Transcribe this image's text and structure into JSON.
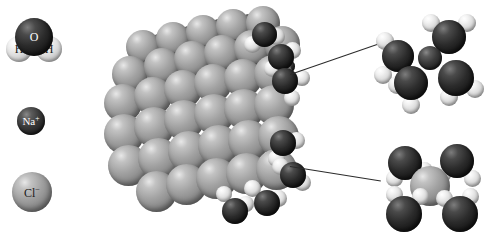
{
  "figure": {
    "background_color": "#ffffff"
  },
  "colors": {
    "chloride": "#a2a2a2",
    "sodium": "#2b2b2b",
    "oxygen": "#1f1f1f",
    "hydrogen": "#e8e8e8",
    "leader_line": "#2b2b2b",
    "label_light": "#ffffff",
    "label_dark": "#1a1a1a"
  },
  "legend": {
    "items": [
      {
        "id": "water",
        "name": "water-molecule",
        "atoms": [
          {
            "symbol": "O",
            "charge": "",
            "kind": "oxygen"
          },
          {
            "symbol": "H",
            "charge": "",
            "kind": "hydrogen"
          },
          {
            "symbol": "H",
            "charge": "",
            "kind": "hydrogen"
          }
        ]
      },
      {
        "id": "sodium",
        "name": "sodium-ion",
        "symbol": "Na",
        "charge": "+",
        "kind": "sodium"
      },
      {
        "id": "chloride",
        "name": "chloride-ion",
        "symbol": "Cl",
        "charge": "−",
        "kind": "chloride"
      }
    ]
  },
  "crystal": {
    "name": "sodium-chloride-lattice",
    "description": "space-filling cubic NaCl crystal"
  },
  "insets": [
    {
      "id": "hydrated-sodium",
      "name": "hydrated-sodium-ion",
      "central_ion": "Na",
      "central_charge": "+",
      "water_count": 4
    },
    {
      "id": "hydrated-chloride",
      "name": "hydrated-chloride-ion",
      "central_ion": "Cl",
      "central_charge": "−",
      "water_count": 4
    }
  ]
}
